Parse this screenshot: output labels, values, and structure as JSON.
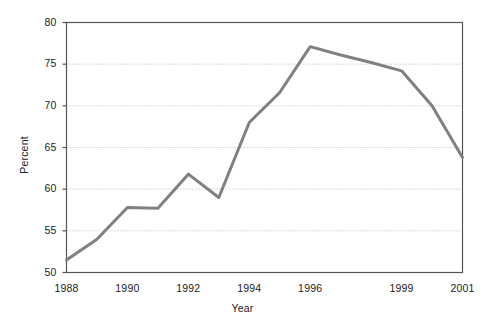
{
  "chart_data": {
    "type": "line",
    "title": "",
    "xlabel": "Year",
    "ylabel": "Percent",
    "ylim": [
      50,
      80
    ],
    "yticks": [
      50,
      55,
      60,
      65,
      70,
      75,
      80
    ],
    "ytick_labels": [
      "50",
      "55",
      "60",
      "65",
      "70",
      "75",
      "80"
    ],
    "grid": "horizontal-dotted",
    "legend": "none",
    "line_color": "#808080",
    "line_width": 3,
    "categories": [
      "1988",
      "1989",
      "1990",
      "1991",
      "1992",
      "1993",
      "1994",
      "1995",
      "1996",
      "1997",
      "1998",
      "1999",
      "2000",
      "2001"
    ],
    "xtick_labels": [
      "1988",
      "1990",
      "1992",
      "1994",
      "1996",
      "1999",
      "2001"
    ],
    "xtick_indices": [
      0,
      2,
      4,
      6,
      8,
      11,
      13
    ],
    "values": [
      51.5,
      54.0,
      57.8,
      57.7,
      61.8,
      59.0,
      68.0,
      71.6,
      77.1,
      76.1,
      75.2,
      74.2,
      70.0,
      63.8
    ]
  },
  "axes": {
    "y_axis_title": "Percent",
    "x_axis_title": "Year"
  }
}
